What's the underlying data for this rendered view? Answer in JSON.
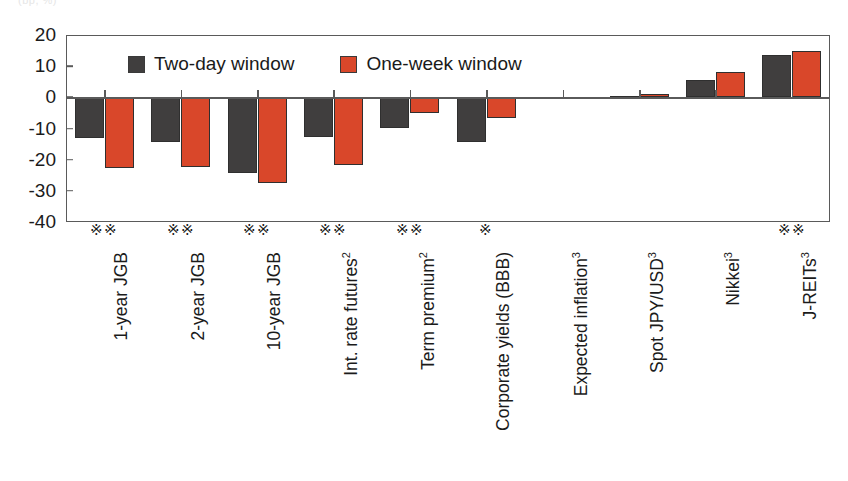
{
  "top_caption": "(bp, %)",
  "legend": {
    "items": [
      {
        "label": "Two-day window",
        "color": "#403e3e",
        "icon": "legend-swatch"
      },
      {
        "label": "One-week window",
        "color": "#d9472a",
        "icon": "legend-swatch"
      }
    ]
  },
  "significance_symbol": "※",
  "chart_data": {
    "type": "bar",
    "title": "",
    "subtitle": "",
    "xlabel": "",
    "ylabel": "",
    "ylim": [
      -40,
      20
    ],
    "yticks": [
      20,
      10,
      0,
      -10,
      -20,
      -30,
      -40
    ],
    "ytick_labels": [
      "20",
      "10",
      "0",
      "-10",
      "-20",
      "-30",
      "-40"
    ],
    "grid": false,
    "legend_position": "inside-top",
    "orientation": "vertical",
    "categories": [
      "1-year JGB",
      "2-year JGB",
      "10-year JGB",
      "Int. rate futures2",
      "Term premium2",
      "Corporate yields (BBB)",
      "Expected inflation3",
      "Spot JPY/USD3",
      "Nikkei3",
      "J-REITs3"
    ],
    "category_labels_html": [
      "1-year JGB",
      "2-year JGB",
      "10-year JGB",
      "Int. rate futures<sup>2</sup>",
      "Term premium<sup>2</sup>",
      "Corporate yields (BBB)",
      "Expected inflation<sup>3</sup>",
      "Spot JPY/USD<sup>3</sup>",
      "Nikkei<sup>3</sup>",
      "J-REITs<sup>3</sup>"
    ],
    "series": [
      {
        "name": "Two-day window",
        "color": "#403e3e",
        "values": [
          -13.2,
          -14.3,
          -24.2,
          -12.8,
          -10.0,
          -14.3,
          0.0,
          0.3,
          5.5,
          13.5
        ]
      },
      {
        "name": "One-week window",
        "color": "#d9472a",
        "values": [
          -22.8,
          -22.3,
          -27.5,
          -21.8,
          -5.0,
          -6.5,
          0.2,
          1.0,
          8.0,
          15.0
        ]
      }
    ],
    "annotations": [
      {
        "category": "1-year JGB",
        "marks": 2
      },
      {
        "category": "2-year JGB",
        "marks": 2
      },
      {
        "category": "10-year JGB",
        "marks": 2
      },
      {
        "category": "Int. rate futures2",
        "marks": 2
      },
      {
        "category": "Term premium2",
        "marks": 2
      },
      {
        "category": "Corporate yields (BBB)",
        "marks": 1
      },
      {
        "category": "Expected inflation3",
        "marks": 0
      },
      {
        "category": "Spot JPY/USD3",
        "marks": 0
      },
      {
        "category": "Nikkei3",
        "marks": 0
      },
      {
        "category": "J-REITs3",
        "marks": 2
      }
    ]
  }
}
